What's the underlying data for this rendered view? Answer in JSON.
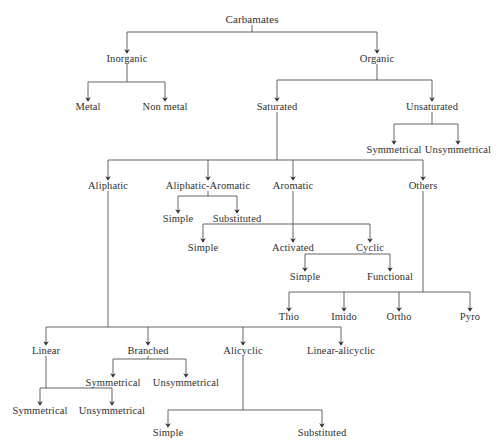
{
  "figure": {
    "title": "Carbamates",
    "caption_fragment": "",
    "style": {
      "line_color": "#4a4a4a",
      "text_color": "#30302f",
      "background": "#ffffff"
    }
  },
  "nodes": [
    {
      "id": "carbamates",
      "label": "Carbamates",
      "x": 252,
      "y": 14,
      "level": 0
    },
    {
      "id": "inorganic",
      "label": "Inorganic",
      "x": 127,
      "y": 53,
      "level": 1
    },
    {
      "id": "organic",
      "label": "Organic",
      "x": 377,
      "y": 53,
      "level": 1
    },
    {
      "id": "metal",
      "label": "Metal",
      "x": 88,
      "y": 101,
      "level": 2
    },
    {
      "id": "non-metal",
      "label": "Non metal",
      "x": 165,
      "y": 101,
      "level": 2
    },
    {
      "id": "saturated",
      "label": "Saturated",
      "x": 277,
      "y": 101,
      "level": 2
    },
    {
      "id": "unsaturated",
      "label": "Unsaturated",
      "x": 432,
      "y": 101,
      "level": 2
    },
    {
      "id": "uns-symmetrical",
      "label": "Symmetrical",
      "x": 394,
      "y": 144,
      "level": 3
    },
    {
      "id": "uns-unsymmetrical",
      "label": "Unsymmetrical",
      "x": 458,
      "y": 144,
      "level": 3
    },
    {
      "id": "aliphatic",
      "label": "Aliphatic",
      "x": 108,
      "y": 180,
      "level": 3
    },
    {
      "id": "aliphatic-aromatic",
      "label": "Aliphatic-Aromatic",
      "x": 208,
      "y": 180,
      "level": 3
    },
    {
      "id": "aromatic",
      "label": "Aromatic",
      "x": 293,
      "y": 180,
      "level": 3
    },
    {
      "id": "others",
      "label": "Others",
      "x": 423,
      "y": 180,
      "level": 3
    },
    {
      "id": "aa-simple",
      "label": "Simple",
      "x": 178,
      "y": 213,
      "level": 4
    },
    {
      "id": "aa-substituted",
      "label": "Substituted",
      "x": 237,
      "y": 213,
      "level": 4
    },
    {
      "id": "ar-simple",
      "label": "Simple",
      "x": 203,
      "y": 242,
      "level": 4
    },
    {
      "id": "ar-activated",
      "label": "Activated",
      "x": 293,
      "y": 242,
      "level": 4
    },
    {
      "id": "ar-cyclic",
      "label": "Cyclic",
      "x": 370,
      "y": 242,
      "level": 4
    },
    {
      "id": "cyc-simple",
      "label": "Simple",
      "x": 305,
      "y": 271,
      "level": 5
    },
    {
      "id": "cyc-functional",
      "label": "Functional",
      "x": 390,
      "y": 271,
      "level": 5
    },
    {
      "id": "thio",
      "label": "Thio",
      "x": 289,
      "y": 311,
      "level": 4
    },
    {
      "id": "imido",
      "label": "Imido",
      "x": 344,
      "y": 311,
      "level": 4
    },
    {
      "id": "ortho",
      "label": "Ortho",
      "x": 399,
      "y": 311,
      "level": 4
    },
    {
      "id": "pyro",
      "label": "Pyro",
      "x": 470,
      "y": 311,
      "level": 4
    },
    {
      "id": "linear",
      "label": "Linear",
      "x": 46,
      "y": 345,
      "level": 4
    },
    {
      "id": "branched",
      "label": "Branched",
      "x": 148,
      "y": 345,
      "level": 4
    },
    {
      "id": "alicyclic",
      "label": "Alicyclic",
      "x": 243,
      "y": 345,
      "level": 4
    },
    {
      "id": "linear-alicyclic",
      "label": "Linear-alicyclic",
      "x": 341,
      "y": 345,
      "level": 4
    },
    {
      "id": "br-symmetrical",
      "label": "Symmetrical",
      "x": 113,
      "y": 377,
      "level": 5
    },
    {
      "id": "br-unsymmetrical",
      "label": "Unsymmetrical",
      "x": 186,
      "y": 377,
      "level": 5
    },
    {
      "id": "lin-symmetrical",
      "label": "Symmetrical",
      "x": 40,
      "y": 405,
      "level": 5
    },
    {
      "id": "lin-unsymmetrical",
      "label": "Unsymmetrical",
      "x": 112,
      "y": 405,
      "level": 5
    },
    {
      "id": "ali-simple",
      "label": "Simple",
      "x": 168,
      "y": 427,
      "level": 5
    },
    {
      "id": "ali-substituted",
      "label": "Substituted",
      "x": 322,
      "y": 427,
      "level": 5
    }
  ],
  "edges": [
    {
      "parent": "carbamates",
      "children": [
        "inorganic",
        "organic"
      ]
    },
    {
      "parent": "inorganic",
      "children": [
        "metal",
        "non-metal"
      ]
    },
    {
      "parent": "organic",
      "children": [
        "saturated",
        "unsaturated"
      ]
    },
    {
      "parent": "unsaturated",
      "children": [
        "uns-symmetrical",
        "uns-unsymmetrical"
      ]
    },
    {
      "parent": "saturated",
      "children": [
        "aliphatic",
        "aliphatic-aromatic",
        "aromatic",
        "others"
      ]
    },
    {
      "parent": "aliphatic-aromatic",
      "children": [
        "aa-simple",
        "aa-substituted"
      ]
    },
    {
      "parent": "aromatic",
      "children": [
        "ar-simple",
        "ar-activated",
        "ar-cyclic"
      ]
    },
    {
      "parent": "ar-cyclic",
      "children": [
        "cyc-simple",
        "cyc-functional"
      ]
    },
    {
      "parent": "others",
      "children": [
        "thio",
        "imido",
        "ortho",
        "pyro"
      ]
    },
    {
      "parent": "aliphatic",
      "children": [
        "linear",
        "branched",
        "alicyclic",
        "linear-alicyclic"
      ]
    },
    {
      "parent": "branched",
      "children": [
        "br-symmetrical",
        "br-unsymmetrical"
      ]
    },
    {
      "parent": "linear",
      "children": [
        "lin-symmetrical",
        "lin-unsymmetrical"
      ]
    },
    {
      "parent": "alicyclic",
      "children": [
        "ali-simple",
        "ali-substituted"
      ]
    }
  ],
  "edge_geometry": {
    "carbamates": {
      "bus_y": 32
    },
    "inorganic": {
      "bus_y": 82
    },
    "organic": {
      "bus_y": 80
    },
    "unsaturated": {
      "bus_y": 124
    },
    "saturated": {
      "bus_y": 160
    },
    "aliphatic-aromatic": {
      "bus_y": 196
    },
    "aromatic": {
      "bus_y": 224
    },
    "ar-cyclic": {
      "bus_y": 254
    },
    "others": {
      "bus_y": 292
    },
    "aliphatic": {
      "bus_y": 327
    },
    "branched": {
      "bus_y": 359
    },
    "linear": {
      "bus_y": 388
    },
    "alicyclic": {
      "bus_y": 410
    }
  }
}
